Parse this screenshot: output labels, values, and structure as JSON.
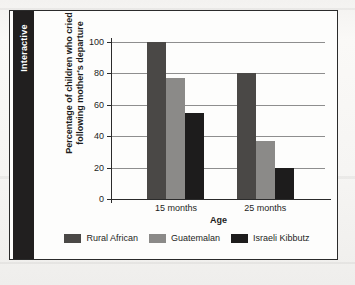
{
  "overlay": {
    "interactive_tab_label": "Interactive"
  },
  "chart_data": {
    "type": "bar",
    "title": "",
    "xlabel": "Age",
    "ylabel": "Percentage of children who cried following mother's departure",
    "ylabel_lines": [
      "Percentage of children who cried",
      "following mother's departure"
    ],
    "categories": [
      "15 months",
      "25 months"
    ],
    "yticks": [
      0,
      20,
      40,
      60,
      80,
      100
    ],
    "ylim": [
      0,
      100
    ],
    "grid": true,
    "legend_position": "bottom",
    "series": [
      {
        "name": "Rural African",
        "color": "#4a4846",
        "values": [
          100,
          80
        ]
      },
      {
        "name": "Guatemalan",
        "color": "#8b8a88",
        "values": [
          77,
          37
        ]
      },
      {
        "name": "Israeli Kibbutz",
        "color": "#1d1c1c",
        "values": [
          55,
          20
        ]
      }
    ]
  }
}
